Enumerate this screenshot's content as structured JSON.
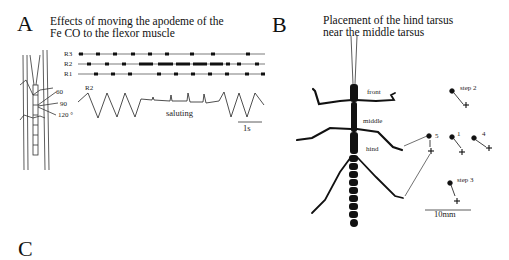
{
  "panels": {
    "A": {
      "letter": "A",
      "title_line1": "Effects of moving the apodeme of the",
      "title_line2": "Fe CO to the flexor muscle",
      "raster_labels": [
        "R3",
        "R2",
        "R1"
      ],
      "trace_label": "R2",
      "angle_labels": [
        "60",
        "90",
        "120 °"
      ],
      "annotation": "saluting",
      "scale_bar_label": "1s"
    },
    "B": {
      "letter": "B",
      "title_line1": "Placement of the hind tarsus",
      "title_line2": "near the middle tarsus",
      "leg_labels": [
        "front",
        "middle",
        "hind"
      ],
      "step_labels": [
        "step 2",
        "5",
        "1",
        "4",
        "step 3"
      ],
      "scale_bar_label": "10mm"
    },
    "C": {
      "letter": "C"
    }
  }
}
